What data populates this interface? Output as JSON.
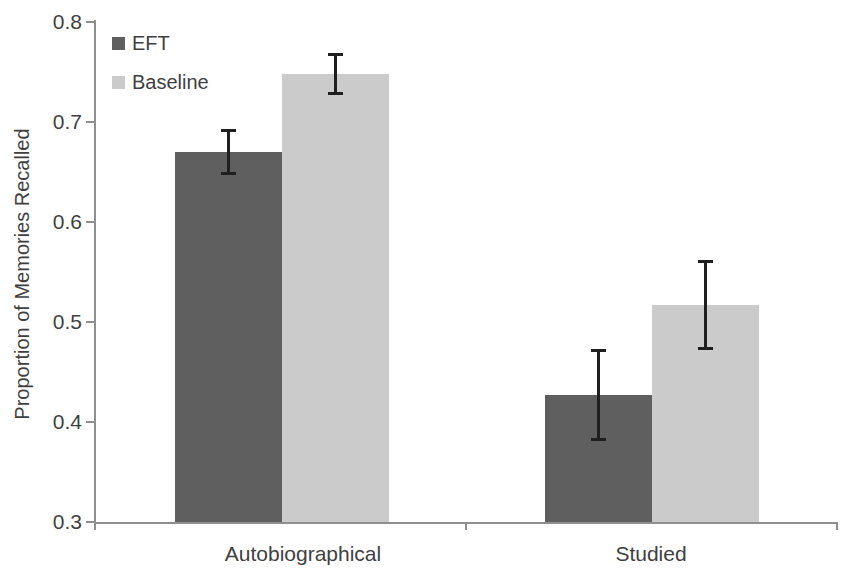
{
  "chart_data": {
    "type": "bar",
    "title": "",
    "xlabel": "",
    "ylabel": "Proportion of Memories Recalled",
    "categories": [
      "Autobiographical",
      "Studied"
    ],
    "series": [
      {
        "name": "EFT",
        "color": "#5f5f5f",
        "values": [
          0.67,
          0.427
        ],
        "errors": [
          0.022,
          0.045
        ]
      },
      {
        "name": "Baseline",
        "color": "#cbcbcb",
        "values": [
          0.748,
          0.517
        ],
        "errors": [
          0.02,
          0.044
        ]
      }
    ],
    "ylim": [
      0.3,
      0.8
    ],
    "ytick_step": 0.1,
    "ytick_labels": [
      "0.3",
      "0.4",
      "0.5",
      "0.6",
      "0.7",
      "0.8"
    ],
    "grid": false,
    "error_bars": true,
    "legend_position": "top-left",
    "colors": {
      "axis": "#8f8f8f",
      "text": "#3f3f3f",
      "error_bar": "#1f1f1f",
      "background": "#ffffff"
    }
  }
}
